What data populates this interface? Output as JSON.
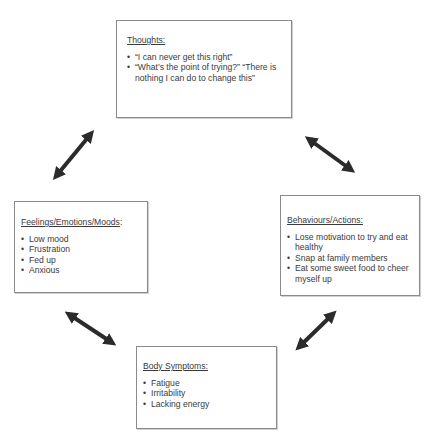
{
  "diagram": {
    "type": "cognitive-behavioural cycle",
    "boxes": {
      "thoughts": {
        "title": "Thoughts:",
        "items": [
          "“I can never get this right”",
          "“What’s the point of trying?” “There is nothing I can do to change this”"
        ]
      },
      "feelings": {
        "title": "Feelings/Emotions/Moods",
        "title_suffix": ":",
        "items": [
          "Low mood",
          "Frustration",
          "Fed up",
          "Anxious"
        ]
      },
      "behaviours": {
        "title": "Behaviours/Actions:",
        "items": [
          "Lose motivation to try and eat healthy",
          "Snap at family members",
          "Eat some sweet food to cheer myself up"
        ]
      },
      "body": {
        "title": "Body Symptoms:",
        "items": [
          "Fatigue",
          "Irritability",
          "Lacking energy"
        ]
      }
    },
    "arrows": [
      {
        "from": "feelings",
        "to": "thoughts",
        "style": "double-headed"
      },
      {
        "from": "thoughts",
        "to": "behaviours",
        "style": "double-headed"
      },
      {
        "from": "feelings",
        "to": "body",
        "style": "double-headed"
      },
      {
        "from": "body",
        "to": "behaviours",
        "style": "double-headed"
      }
    ],
    "colors": {
      "arrow": "#2b2b2b",
      "border": "#8a8a8a",
      "text": "#3a3a3a"
    }
  }
}
